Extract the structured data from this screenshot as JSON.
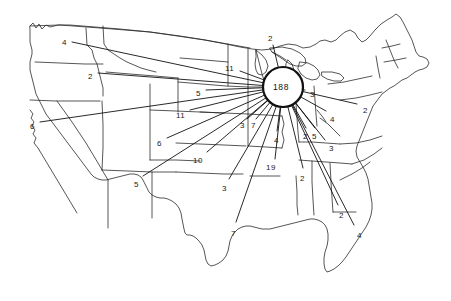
{
  "figure": {
    "type": "flow-map",
    "title": "",
    "hub": {
      "name": "hub-node",
      "value": "188",
      "x": 283,
      "y": 87,
      "radius": 20
    },
    "style": {
      "line_color": "#1a1a1a",
      "map_outline_color": "#2b2b2b",
      "background": "#ffffff",
      "label_color": "#1a1a1a"
    },
    "flows": [
      {
        "id": "flow-wa",
        "label": "4",
        "lx": 62,
        "ly": 39,
        "ex": 72,
        "ey": 42,
        "region": "washington"
      },
      {
        "id": "flow-id",
        "label": "2",
        "lx": 88,
        "ly": 73,
        "ex": 98,
        "ey": 73,
        "region": "idaho"
      },
      {
        "id": "flow-ca",
        "label": "6",
        "lx": 30,
        "ly": 123,
        "ex": 40,
        "ey": 122,
        "region": "california"
      },
      {
        "id": "flow-nm",
        "label": "5",
        "lx": 134,
        "ly": 181,
        "ex": 143,
        "ey": 176,
        "region": "new-mexico"
      },
      {
        "id": "flow-co",
        "label": "6",
        "lx": 157,
        "ly": 140,
        "ex": 167,
        "ey": 138,
        "region": "colorado"
      },
      {
        "id": "flow-sd",
        "label": "5",
        "lx": 196,
        "ly": 90,
        "ex": 206,
        "ey": 90,
        "region": "south-dakota"
      },
      {
        "id": "flow-ne",
        "label": "11",
        "lx": 176,
        "ly": 112,
        "ex": 190,
        "ey": 110,
        "region": "nebraska"
      },
      {
        "id": "flow-mn",
        "label": "11",
        "lx": 225,
        "ly": 65,
        "ex": 240,
        "ey": 71,
        "region": "minnesota"
      },
      {
        "id": "flow-can",
        "label": "2",
        "lx": 268,
        "ly": 35,
        "ex": 273,
        "ey": 45,
        "region": "north"
      },
      {
        "id": "flow-ks",
        "label": "10",
        "lx": 193,
        "ly": 157,
        "ex": 207,
        "ey": 152,
        "region": "kansas"
      },
      {
        "id": "flow-ok",
        "label": "3",
        "lx": 222,
        "ly": 185,
        "ex": 229,
        "ey": 179,
        "region": "oklahoma"
      },
      {
        "id": "flow-ia",
        "label": "3",
        "lx": 240,
        "ly": 122,
        "ex": 247,
        "ey": 119,
        "region": "iowa"
      },
      {
        "id": "flow-il",
        "label": "7",
        "lx": 251,
        "ly": 122,
        "ex": 256,
        "ey": 119,
        "region": "illinois"
      },
      {
        "id": "flow-mo",
        "label": "4",
        "lx": 274,
        "ly": 137,
        "ex": 277,
        "ey": 131,
        "region": "missouri"
      },
      {
        "id": "flow-ar",
        "label": "19",
        "lx": 266,
        "ly": 164,
        "ex": 275,
        "ey": 159,
        "region": "arkansas"
      },
      {
        "id": "flow-tx",
        "label": "7",
        "lx": 231,
        "ly": 230,
        "ex": 236,
        "ey": 222,
        "region": "texas"
      },
      {
        "id": "flow-ms",
        "label": "2",
        "lx": 300,
        "ly": 175,
        "ex": 303,
        "ey": 168,
        "region": "mississippi"
      },
      {
        "id": "flow-in",
        "label": "2",
        "lx": 303,
        "ly": 133,
        "ex": 306,
        "ey": 128,
        "region": "indiana"
      },
      {
        "id": "flow-ky",
        "label": "5",
        "lx": 312,
        "ly": 133,
        "ex": 315,
        "ey": 128,
        "region": "kentucky"
      },
      {
        "id": "flow-oh",
        "label": "4",
        "lx": 330,
        "ly": 116,
        "ex": 326,
        "ey": 111,
        "region": "ohio"
      },
      {
        "id": "flow-tn",
        "label": "3",
        "lx": 329,
        "ly": 145,
        "ex": 325,
        "ey": 140,
        "region": "tennessee"
      },
      {
        "id": "flow-pa",
        "label": "2",
        "lx": 363,
        "ly": 107,
        "ex": 357,
        "ey": 104,
        "region": "pennsylvania"
      },
      {
        "id": "flow-mi",
        "label": "3",
        "lx": 310,
        "ly": 91,
        "ex": 305,
        "ey": 90,
        "region": "michigan"
      },
      {
        "id": "flow-ga",
        "label": "2",
        "lx": 339,
        "ly": 212,
        "ex": 338,
        "ey": 205,
        "region": "georgia"
      },
      {
        "id": "flow-fl",
        "label": "4",
        "lx": 357,
        "ly": 232,
        "ex": 354,
        "ey": 225,
        "region": "florida"
      }
    ],
    "leaders": [
      {
        "id": "lead-wa",
        "x1": 72,
        "y1": 42,
        "x2": 283,
        "y2": 87
      },
      {
        "id": "lead-id",
        "x1": 98,
        "y1": 73,
        "x2": 283,
        "y2": 87
      },
      {
        "id": "lead-ca",
        "x1": 40,
        "y1": 122,
        "x2": 283,
        "y2": 87
      },
      {
        "id": "lead-nm",
        "x1": 143,
        "y1": 176,
        "x2": 283,
        "y2": 87
      },
      {
        "id": "lead-co",
        "x1": 167,
        "y1": 138,
        "x2": 283,
        "y2": 87
      },
      {
        "id": "lead-sd",
        "x1": 206,
        "y1": 90,
        "x2": 283,
        "y2": 87
      },
      {
        "id": "lead-ne",
        "x1": 190,
        "y1": 110,
        "x2": 283,
        "y2": 87
      },
      {
        "id": "lead-mn",
        "x1": 240,
        "y1": 71,
        "x2": 283,
        "y2": 87
      },
      {
        "id": "lead-can",
        "x1": 273,
        "y1": 45,
        "x2": 283,
        "y2": 87
      },
      {
        "id": "lead-ks",
        "x1": 207,
        "y1": 152,
        "x2": 283,
        "y2": 87
      },
      {
        "id": "lead-ok",
        "x1": 229,
        "y1": 179,
        "x2": 283,
        "y2": 87
      },
      {
        "id": "lead-ia",
        "x1": 247,
        "y1": 119,
        "x2": 283,
        "y2": 87
      },
      {
        "id": "lead-il",
        "x1": 256,
        "y1": 119,
        "x2": 283,
        "y2": 87
      },
      {
        "id": "lead-mo",
        "x1": 277,
        "y1": 131,
        "x2": 283,
        "y2": 87
      },
      {
        "id": "lead-ar",
        "x1": 275,
        "y1": 159,
        "x2": 283,
        "y2": 87
      },
      {
        "id": "lead-tx",
        "x1": 236,
        "y1": 222,
        "x2": 283,
        "y2": 87
      },
      {
        "id": "lead-ms",
        "x1": 303,
        "y1": 168,
        "x2": 283,
        "y2": 87
      },
      {
        "id": "lead-in",
        "x1": 306,
        "y1": 128,
        "x2": 283,
        "y2": 87
      },
      {
        "id": "lead-ky",
        "x1": 315,
        "y1": 128,
        "x2": 283,
        "y2": 87
      },
      {
        "id": "lead-oh",
        "x1": 326,
        "y1": 111,
        "x2": 283,
        "y2": 87
      },
      {
        "id": "lead-tn",
        "x1": 325,
        "y1": 140,
        "x2": 283,
        "y2": 87
      },
      {
        "id": "lead-pa",
        "x1": 357,
        "y1": 104,
        "x2": 283,
        "y2": 87
      },
      {
        "id": "lead-mi",
        "x1": 305,
        "y1": 90,
        "x2": 283,
        "y2": 87
      },
      {
        "id": "lead-ga",
        "x1": 338,
        "y1": 205,
        "x2": 283,
        "y2": 87
      },
      {
        "id": "lead-fl",
        "x1": 354,
        "y1": 225,
        "x2": 283,
        "y2": 87
      }
    ]
  }
}
